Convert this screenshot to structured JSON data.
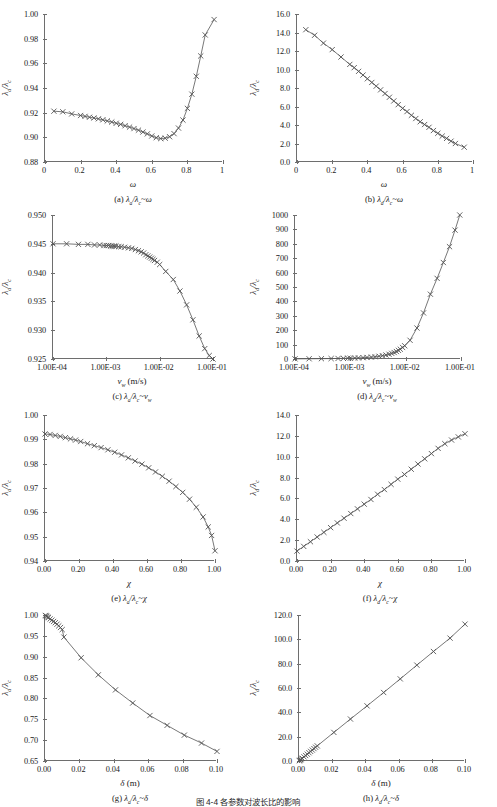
{
  "figure": {
    "bottom_caption": "图 4-4  各参数对波长比的影响",
    "marker": "x-cross",
    "line_color": "#555555",
    "axis_color": "#6e6e6e"
  },
  "chart_data": [
    {
      "id": "a",
      "type": "line",
      "title": "(a) λa/λc ~ ω",
      "caption_prefix": "(a)",
      "ylabel": "λa/λc",
      "ylabel_num": "λ",
      "ylabel_num_sub": "a",
      "ylabel_den": "λ",
      "ylabel_den_sub": "c",
      "xlabel": "ω",
      "xlabel_unit": "",
      "xscale": "linear",
      "xlim": [
        0,
        1
      ],
      "ylim": [
        0.88,
        1.0
      ],
      "xticks": [
        "0",
        "0.2",
        "0.4",
        "0.6",
        "0.8",
        "1"
      ],
      "xtickvals": [
        0,
        0.2,
        0.4,
        0.6,
        0.8,
        1.0
      ],
      "yticks": [
        "0.88",
        "0.90",
        "0.92",
        "0.94",
        "0.96",
        "0.98",
        "1.00"
      ],
      "ytickvals": [
        0.88,
        0.9,
        0.92,
        0.94,
        0.96,
        0.98,
        1.0
      ],
      "x": [
        0.05,
        0.1,
        0.15,
        0.2,
        0.225,
        0.25,
        0.275,
        0.3,
        0.325,
        0.35,
        0.375,
        0.4,
        0.425,
        0.45,
        0.475,
        0.5,
        0.525,
        0.55,
        0.575,
        0.6,
        0.625,
        0.65,
        0.675,
        0.7,
        0.725,
        0.75,
        0.775,
        0.8,
        0.825,
        0.85,
        0.875,
        0.9,
        0.95
      ],
      "y": [
        0.9212,
        0.9207,
        0.919,
        0.9177,
        0.917,
        0.9163,
        0.9157,
        0.915,
        0.9142,
        0.9133,
        0.9124,
        0.9114,
        0.9105,
        0.9094,
        0.9083,
        0.9071,
        0.9058,
        0.9043,
        0.9028,
        0.9011,
        0.8997,
        0.899,
        0.8993,
        0.9005,
        0.903,
        0.9075,
        0.914,
        0.9235,
        0.935,
        0.9495,
        0.966,
        0.983,
        0.9955
      ]
    },
    {
      "id": "b",
      "type": "line",
      "title": "(b) λd/λc ~ ω",
      "caption_prefix": "(b)",
      "ylabel": "λd/λc",
      "ylabel_num": "λ",
      "ylabel_num_sub": "d",
      "ylabel_den": "λ",
      "ylabel_den_sub": "c",
      "xlabel": "ω",
      "xlabel_unit": "",
      "xscale": "linear",
      "xlim": [
        0,
        1
      ],
      "ylim": [
        0.0,
        16.0
      ],
      "xticks": [
        "0",
        "0.2",
        "0.4",
        "0.6",
        "0.8",
        "1"
      ],
      "xtickvals": [
        0,
        0.2,
        0.4,
        0.6,
        0.8,
        1.0
      ],
      "yticks": [
        "0.0",
        "2.0",
        "4.0",
        "6.0",
        "8.0",
        "10.0",
        "12.0",
        "14.0",
        "16.0"
      ],
      "ytickvals": [
        0,
        2,
        4,
        6,
        8,
        10,
        12,
        14,
        16
      ],
      "x": [
        0.05,
        0.1,
        0.15,
        0.2,
        0.25,
        0.3,
        0.325,
        0.35,
        0.375,
        0.4,
        0.425,
        0.45,
        0.475,
        0.5,
        0.525,
        0.55,
        0.575,
        0.6,
        0.625,
        0.65,
        0.675,
        0.7,
        0.725,
        0.75,
        0.775,
        0.8,
        0.825,
        0.85,
        0.875,
        0.9,
        0.95
      ],
      "y": [
        14.3,
        13.7,
        12.85,
        12.15,
        11.35,
        10.55,
        10.2,
        9.8,
        9.4,
        9.0,
        8.6,
        8.2,
        7.8,
        7.4,
        7.0,
        6.6,
        6.2,
        5.8,
        5.45,
        5.05,
        4.7,
        4.35,
        4.05,
        3.75,
        3.4,
        3.1,
        2.8,
        2.55,
        2.25,
        2.0,
        1.6
      ]
    },
    {
      "id": "c",
      "type": "line",
      "title": "(c) λa/λc ~ vw",
      "caption_prefix": "(c)",
      "ylabel": "λa/λc",
      "ylabel_num": "λ",
      "ylabel_num_sub": "a",
      "ylabel_den": "λ",
      "ylabel_den_sub": "c",
      "xlabel": "v",
      "xlabel_sub": "w",
      "xlabel_unit": "(m/s)",
      "xscale": "log",
      "xlim": [
        0.0001,
        0.1
      ],
      "ylim": [
        0.925,
        0.95
      ],
      "xticks": [
        "1.00E-04",
        "1.00E-03",
        "1.00E-02",
        "1.00E-01"
      ],
      "xtickvals": [
        0.0001,
        0.001,
        0.01,
        0.1
      ],
      "yticks": [
        "0.925",
        "0.930",
        "0.935",
        "0.940",
        "0.945",
        "0.950"
      ],
      "ytickvals": [
        0.925,
        0.93,
        0.935,
        0.94,
        0.945,
        0.95
      ],
      "x": [
        0.0001,
        0.00018,
        0.0003,
        0.00045,
        0.0006,
        0.00075,
        0.0009,
        0.001,
        0.0011,
        0.0012,
        0.0013,
        0.0014,
        0.0015,
        0.0017,
        0.0019,
        0.0022,
        0.0026,
        0.003,
        0.0035,
        0.004,
        0.0045,
        0.005,
        0.0055,
        0.006,
        0.0065,
        0.007,
        0.0075,
        0.008,
        0.009,
        0.01,
        0.013,
        0.018,
        0.024,
        0.032,
        0.042,
        0.055,
        0.07,
        0.085,
        0.1
      ],
      "y": [
        0.945,
        0.945,
        0.9449,
        0.9449,
        0.9448,
        0.9448,
        0.9447,
        0.9447,
        0.9447,
        0.9446,
        0.9446,
        0.9446,
        0.9446,
        0.9445,
        0.9445,
        0.9444,
        0.9443,
        0.9442,
        0.944,
        0.9438,
        0.9436,
        0.9434,
        0.9431,
        0.9429,
        0.9427,
        0.9425,
        0.9423,
        0.9421,
        0.9418,
        0.9414,
        0.9402,
        0.9388,
        0.9368,
        0.9344,
        0.9318,
        0.929,
        0.9268,
        0.9256,
        0.925
      ]
    },
    {
      "id": "d",
      "type": "line",
      "title": "(d) λd/λc ~ vw",
      "caption_prefix": "(d)",
      "ylabel": "λd/λc",
      "ylabel_num": "λ",
      "ylabel_num_sub": "d",
      "ylabel_den": "λ",
      "ylabel_den_sub": "c",
      "xlabel": "v",
      "xlabel_sub": "w",
      "xlabel_unit": "(m/s)",
      "xscale": "log",
      "xlim": [
        0.0001,
        0.1
      ],
      "ylim": [
        0,
        1000
      ],
      "xticks": [
        "1.00E-04",
        "1.00E-03",
        "1.00E-02",
        "1.00E-01"
      ],
      "xtickvals": [
        0.0001,
        0.001,
        0.01,
        0.1
      ],
      "yticks": [
        "0",
        "100",
        "200",
        "300",
        "400",
        "500",
        "600",
        "700",
        "800",
        "900",
        "1000"
      ],
      "ytickvals": [
        0,
        100,
        200,
        300,
        400,
        500,
        600,
        700,
        800,
        900,
        1000
      ],
      "x": [
        0.0001,
        0.00018,
        0.0003,
        0.00045,
        0.0006,
        0.00075,
        0.0009,
        0.001,
        0.0012,
        0.0014,
        0.0017,
        0.002,
        0.0024,
        0.0028,
        0.0033,
        0.0038,
        0.0044,
        0.005,
        0.0056,
        0.0062,
        0.0068,
        0.0074,
        0.008,
        0.0088,
        0.0096,
        0.012,
        0.016,
        0.021,
        0.028,
        0.037,
        0.048,
        0.062,
        0.078,
        0.095
      ],
      "y": [
        1.0,
        1.5,
        2.2,
        3.0,
        3.8,
        4.5,
        5.3,
        5.8,
        6.8,
        7.8,
        9.3,
        10.8,
        13.0,
        15.5,
        19.0,
        23.0,
        28.0,
        33.0,
        39.0,
        45.0,
        52.0,
        60.0,
        68.0,
        80.0,
        92.0,
        130.0,
        215.0,
        320.0,
        450.0,
        560.0,
        670.0,
        780.0,
        895.0,
        1000.0
      ]
    },
    {
      "id": "e",
      "type": "line",
      "title": "(e) λa/λc ~ χ",
      "caption_prefix": "(e)",
      "ylabel": "λa/λc",
      "ylabel_num": "λ",
      "ylabel_num_sub": "a",
      "ylabel_den": "λ",
      "ylabel_den_sub": "c",
      "xlabel": "χ",
      "xlabel_unit": "",
      "xscale": "linear",
      "xlim": [
        0.0,
        1.0
      ],
      "ylim": [
        0.94,
        1.0
      ],
      "xticks": [
        "0.00",
        "0.20",
        "0.40",
        "0.60",
        "0.80",
        "1.00"
      ],
      "xtickvals": [
        0.0,
        0.2,
        0.4,
        0.6,
        0.8,
        1.0
      ],
      "yticks": [
        "0.94",
        "0.95",
        "0.96",
        "0.97",
        "0.98",
        "0.99",
        "1.00"
      ],
      "ytickvals": [
        0.94,
        0.95,
        0.96,
        0.97,
        0.98,
        0.99,
        1.0
      ],
      "x": [
        0.0,
        0.03,
        0.06,
        0.09,
        0.12,
        0.15,
        0.18,
        0.21,
        0.25,
        0.29,
        0.33,
        0.37,
        0.41,
        0.45,
        0.49,
        0.53,
        0.57,
        0.61,
        0.65,
        0.69,
        0.73,
        0.77,
        0.81,
        0.85,
        0.89,
        0.93,
        0.96,
        0.98,
        1.0
      ],
      "y": [
        0.9922,
        0.992,
        0.9916,
        0.9912,
        0.9907,
        0.9902,
        0.9897,
        0.9891,
        0.9882,
        0.9874,
        0.9866,
        0.9857,
        0.9847,
        0.9836,
        0.9824,
        0.9811,
        0.9798,
        0.9783,
        0.9766,
        0.9748,
        0.9728,
        0.9706,
        0.9682,
        0.9654,
        0.9621,
        0.9581,
        0.954,
        0.9505,
        0.9442
      ]
    },
    {
      "id": "f",
      "type": "line",
      "title": "(f) λd/λc ~ χ",
      "caption_prefix": "(f)",
      "ylabel": "λd/λc",
      "ylabel_num": "λ",
      "ylabel_num_sub": "d",
      "ylabel_den": "λ",
      "ylabel_den_sub": "c",
      "xlabel": "χ",
      "xlabel_unit": "",
      "xscale": "linear",
      "xlim": [
        0.0,
        1.0
      ],
      "ylim": [
        0.0,
        14.0
      ],
      "xticks": [
        "0.00",
        "0.20",
        "0.40",
        "0.60",
        "0.80",
        "1.00"
      ],
      "xtickvals": [
        0.0,
        0.2,
        0.4,
        0.6,
        0.8,
        1.0
      ],
      "yticks": [
        "0.0",
        "2.0",
        "4.0",
        "6.0",
        "8.0",
        "10.0",
        "12.0",
        "14.0"
      ],
      "ytickvals": [
        0,
        2,
        4,
        6,
        8,
        10,
        12,
        14
      ],
      "x": [
        0.0,
        0.04,
        0.08,
        0.12,
        0.16,
        0.2,
        0.24,
        0.28,
        0.32,
        0.36,
        0.4,
        0.44,
        0.48,
        0.52,
        0.56,
        0.6,
        0.64,
        0.68,
        0.72,
        0.76,
        0.8,
        0.84,
        0.88,
        0.92,
        0.96,
        1.0
      ],
      "y": [
        0.95,
        1.4,
        1.85,
        2.3,
        2.75,
        3.2,
        3.65,
        4.1,
        4.55,
        5.0,
        5.45,
        5.9,
        6.4,
        6.85,
        7.35,
        7.85,
        8.3,
        8.8,
        9.3,
        9.8,
        10.3,
        10.8,
        11.25,
        11.6,
        11.9,
        12.2
      ]
    },
    {
      "id": "g",
      "type": "line",
      "title": "(g) λa/λc ~ δ",
      "caption_prefix": "(g)",
      "ylabel": "λa/λc",
      "ylabel_num": "λ",
      "ylabel_num_sub": "a",
      "ylabel_den": "λ",
      "ylabel_den_sub": "c",
      "xlabel": "δ",
      "xlabel_unit": "(m)",
      "xscale": "linear",
      "xlim": [
        0.0,
        0.1
      ],
      "ylim": [
        0.65,
        1.0
      ],
      "xticks": [
        "0.00",
        "0.02",
        "0.04",
        "0.06",
        "0.08",
        "0.10"
      ],
      "xtickvals": [
        0.0,
        0.02,
        0.04,
        0.06,
        0.08,
        0.1
      ],
      "yticks": [
        "0.65",
        "0.70",
        "0.75",
        "0.80",
        "0.85",
        "0.90",
        "0.95",
        "1.00"
      ],
      "ytickvals": [
        0.65,
        0.7,
        0.75,
        0.8,
        0.85,
        0.9,
        0.95,
        1.0
      ],
      "x": [
        0.0002,
        0.0005,
        0.001,
        0.0015,
        0.002,
        0.003,
        0.004,
        0.005,
        0.006,
        0.007,
        0.008,
        0.009,
        0.01,
        0.011,
        0.021,
        0.031,
        0.041,
        0.051,
        0.061,
        0.071,
        0.081,
        0.091,
        0.1
      ],
      "y": [
        0.999,
        0.998,
        0.9965,
        0.995,
        0.9935,
        0.9905,
        0.9875,
        0.9845,
        0.9815,
        0.978,
        0.974,
        0.97,
        0.965,
        0.947,
        0.8975,
        0.8565,
        0.8205,
        0.789,
        0.759,
        0.7355,
        0.712,
        0.693,
        0.673
      ]
    },
    {
      "id": "h",
      "type": "line",
      "title": "(h) λd/λc ~ δ",
      "caption_prefix": "(h)",
      "ylabel": "λd/λc",
      "ylabel_num": "λ",
      "ylabel_num_sub": "d",
      "ylabel_den": "λ",
      "ylabel_den_sub": "c",
      "xlabel": "δ",
      "xlabel_unit": "(m)",
      "xscale": "linear",
      "xlim": [
        0.0,
        0.1
      ],
      "ylim": [
        0.0,
        120.0
      ],
      "xticks": [
        "0.00",
        "0.02",
        "0.04",
        "0.06",
        "0.08",
        "0.10"
      ],
      "xtickvals": [
        0.0,
        0.02,
        0.04,
        0.06,
        0.08,
        0.1
      ],
      "yticks": [
        "0.0",
        "20.0",
        "40.0",
        "60.0",
        "80.0",
        "100.0",
        "120.0"
      ],
      "ytickvals": [
        0,
        20,
        40,
        60,
        80,
        100,
        120
      ],
      "x": [
        0.0002,
        0.0005,
        0.001,
        0.0015,
        0.002,
        0.003,
        0.004,
        0.005,
        0.006,
        0.007,
        0.008,
        0.009,
        0.01,
        0.011,
        0.021,
        0.031,
        0.041,
        0.051,
        0.061,
        0.071,
        0.081,
        0.091,
        0.1
      ],
      "y": [
        0.3,
        0.6,
        1.1,
        1.7,
        2.2,
        3.4,
        4.5,
        5.6,
        6.8,
        7.9,
        9.0,
        10.2,
        11.3,
        12.4,
        23.5,
        34.5,
        45.3,
        56.3,
        67.5,
        78.8,
        90.0,
        101.0,
        112.5
      ]
    }
  ]
}
